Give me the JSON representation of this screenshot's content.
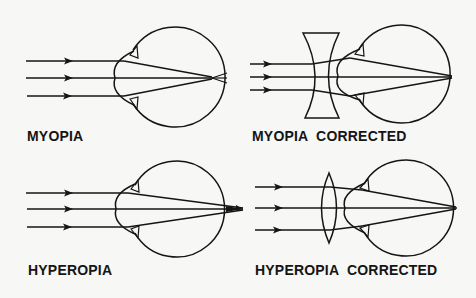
{
  "figure": {
    "background": "#f7f7f5",
    "ink": "#151515",
    "panels": [
      {
        "id": "myopia",
        "label": "MYOPIA"
      },
      {
        "id": "myopia-corrected",
        "label": "MYOPIA  CORRECTED",
        "lens": "concave (diverging)"
      },
      {
        "id": "hyperopia",
        "label": "HYPEROPIA"
      },
      {
        "id": "hyperopia-corrected",
        "label": "HYPEROPIA  CORRECTED",
        "lens": "convex (converging)"
      }
    ]
  }
}
